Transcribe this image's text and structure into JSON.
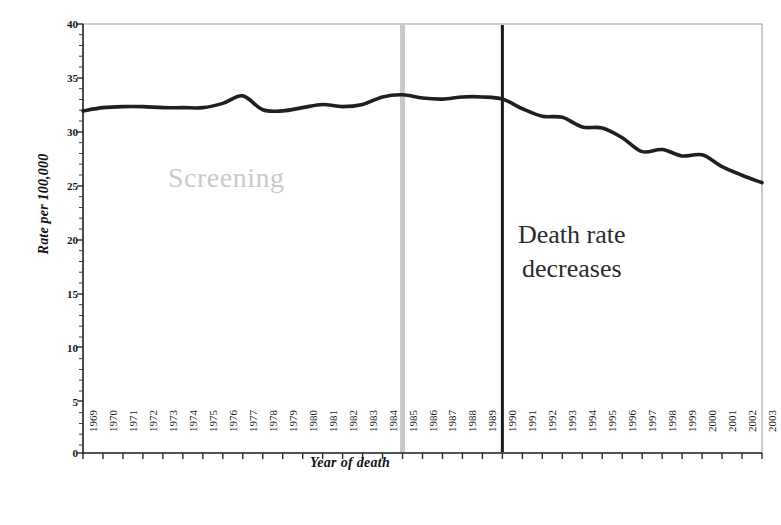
{
  "chart_data": {
    "type": "line",
    "title": "",
    "subtitle": "",
    "xlabel": "Year of death",
    "ylabel": "Rate per 100,000",
    "ylim": [
      0,
      40
    ],
    "ytick_labels": [
      "0",
      "5",
      "10",
      "15",
      "20",
      "25",
      "30",
      "35",
      "40"
    ],
    "ytick_values": [
      0,
      5,
      10,
      15,
      20,
      25,
      30,
      35,
      40
    ],
    "y_minor_tick_step": 1,
    "grid": false,
    "legend": "none",
    "categories": [
      "1969",
      "1970",
      "1971",
      "1972",
      "1973",
      "1974",
      "1975",
      "1976",
      "1977",
      "1978",
      "1979",
      "1980",
      "1981",
      "1982",
      "1983",
      "1984",
      "1985",
      "1986",
      "1987",
      "1988",
      "1989",
      "1990",
      "1991",
      "1992",
      "1993",
      "1994",
      "1995",
      "1996",
      "1997",
      "1998",
      "1999",
      "2000",
      "2001",
      "2002",
      "2003"
    ],
    "values": [
      31.9,
      32.2,
      32.3,
      32.3,
      32.2,
      32.2,
      32.2,
      32.6,
      33.3,
      32.0,
      31.9,
      32.2,
      32.5,
      32.3,
      32.5,
      33.2,
      33.4,
      33.1,
      33.0,
      33.2,
      33.2,
      33.0,
      32.1,
      31.4,
      31.3,
      30.4,
      30.3,
      29.4,
      28.1,
      28.3,
      27.7,
      27.8,
      26.7,
      25.9,
      25.2
    ],
    "series": [
      {
        "name": "Breast cancer death rate",
        "color": "#1f1f1f",
        "values": [
          31.9,
          32.2,
          32.3,
          32.3,
          32.2,
          32.2,
          32.2,
          32.6,
          33.3,
          32.0,
          31.9,
          32.2,
          32.5,
          32.3,
          32.5,
          33.2,
          33.4,
          33.1,
          33.0,
          33.2,
          33.2,
          33.0,
          32.1,
          31.4,
          31.3,
          30.4,
          30.3,
          29.4,
          28.1,
          28.3,
          27.7,
          27.8,
          26.7,
          25.9,
          25.2
        ]
      }
    ],
    "vlines": [
      {
        "name": "screening-marker",
        "year": "1985",
        "color": "#c8c8c8",
        "width": 5
      },
      {
        "name": "death-rate-marker",
        "year": "1990",
        "color": "#1a1a1a",
        "width": 3
      }
    ],
    "annotations": [
      {
        "name": "screening",
        "text": "Screening",
        "color": "#c9c9c9"
      },
      {
        "name": "death-rate-decreases",
        "line1": "Death rate",
        "line2": "decreases",
        "color": "#2b2b2b"
      }
    ]
  },
  "axis": {
    "ylabel": "Rate per 100,000",
    "xlabel": "Year of death",
    "yticks": [
      "40",
      "35",
      "30",
      "25",
      "20",
      "15",
      "10",
      "5",
      "0"
    ],
    "xticks": [
      "1969",
      "1970",
      "1971",
      "1972",
      "1973",
      "1974",
      "1975",
      "1976",
      "1977",
      "1978",
      "1979",
      "1980",
      "1981",
      "1982",
      "1983",
      "1984",
      "1985",
      "1986",
      "1987",
      "1988",
      "1989",
      "1990",
      "1991",
      "1992",
      "1993",
      "1994",
      "1995",
      "1996",
      "1997",
      "1998",
      "1999",
      "2000",
      "2001",
      "2002",
      "2003"
    ]
  },
  "annotations": {
    "screening": "Screening",
    "death_line1": "Death rate",
    "death_line2": "decreases"
  }
}
